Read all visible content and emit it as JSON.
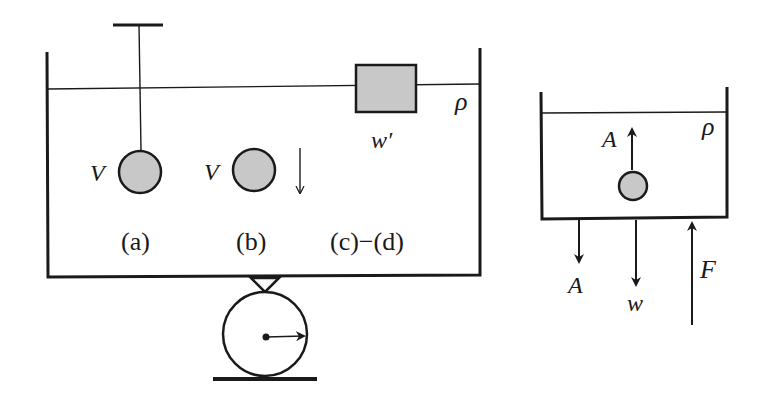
{
  "figure": {
    "left_panel": {
      "liquid_density_label": "ρ",
      "sphere_a_volume_label": "V",
      "sphere_b_volume_label": "V",
      "block_weight_label": "w′",
      "case_labels": {
        "a": "(a)",
        "b": "(b)",
        "cd": "(c)−(d)"
      }
    },
    "right_panel": {
      "liquid_density_label": "ρ",
      "buoyant_force_up_label": "A",
      "reaction_force_down_label": "A",
      "weight_label": "w",
      "support_force_label": "F"
    },
    "colors": {
      "ink": "#1a1a1a",
      "object_fill": "#c8c8c8",
      "background": "#ffffff"
    }
  }
}
